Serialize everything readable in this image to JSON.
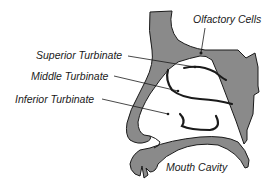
{
  "diagram": {
    "type": "anatomical-cross-section",
    "labels": [
      {
        "id": "olfactory",
        "text": "Olfactory Cells",
        "x": 193,
        "y": 13
      },
      {
        "id": "superior",
        "text": "Superior Turbinate",
        "x": 36,
        "y": 49
      },
      {
        "id": "middle",
        "text": "Middle Turbinate",
        "x": 31,
        "y": 69
      },
      {
        "id": "inferior",
        "text": "Inferior Turbinate",
        "x": 15,
        "y": 93
      },
      {
        "id": "mouth",
        "text": "Mouth Cavity",
        "x": 166,
        "y": 161
      }
    ],
    "colors": {
      "tissue_fill": "#8a8a8a",
      "outline": "#1a1a1a",
      "text": "#1a1a1a",
      "background": "#ffffff"
    }
  }
}
